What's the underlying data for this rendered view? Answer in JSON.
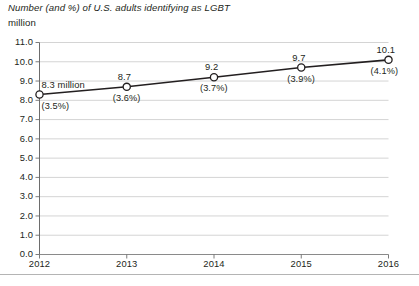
{
  "chart_data": {
    "type": "line",
    "title": "Number (and %) of U.S. adults identifying as LGBT",
    "subtitle": "million",
    "xlabel": "",
    "ylabel": "million",
    "categories": [
      "2012",
      "2013",
      "2014",
      "2015",
      "2016"
    ],
    "values": [
      8.3,
      8.7,
      9.2,
      9.7,
      10.1
    ],
    "point_labels": [
      "8.3 million",
      "8.7",
      "9.2",
      "9.7",
      "10.1"
    ],
    "percent_labels": [
      "(3.5%)",
      "(3.6%)",
      "(3.7%)",
      "(3.9%)",
      "(4.1%)"
    ],
    "percent_values": [
      3.5,
      3.6,
      3.7,
      3.9,
      4.1
    ],
    "ylim": [
      0.0,
      11.0
    ],
    "ytick_step": 1.0,
    "ytick_labels": [
      "11.0",
      "10.0",
      "9.0",
      "8.0",
      "7.0",
      "6.0",
      "5.0",
      "4.0",
      "3.0",
      "2.0",
      "1.0",
      "0.0"
    ],
    "ytick_values": [
      11.0,
      10.0,
      9.0,
      8.0,
      7.0,
      6.0,
      5.0,
      4.0,
      3.0,
      2.0,
      1.0,
      0.0
    ],
    "grid": true,
    "legend": "none",
    "series": [
      {
        "name": "Number of U.S. adults identifying as LGBT (million)",
        "values": [
          8.3,
          8.7,
          9.2,
          9.7,
          10.1
        ]
      }
    ],
    "colors": {
      "line": "#231f20",
      "marker_fill": "#ffffff",
      "marker_stroke": "#231f20",
      "gridline": "#c9c9c9",
      "axis": "#6d6d6d",
      "baseline": "#8a8a8a",
      "text": "#231f20",
      "bottom_rule": "#b4b4b4"
    }
  }
}
